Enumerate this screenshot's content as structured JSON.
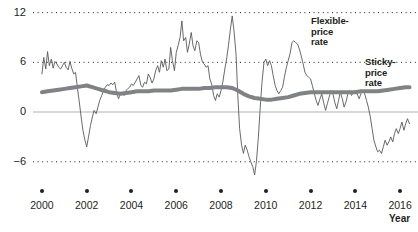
{
  "chart_data": {
    "type": "line",
    "title": "",
    "xlabel": "Year",
    "ylabel": "",
    "xlim": [
      1999.6,
      2016.8
    ],
    "ylim": [
      -8.2,
      12.8
    ],
    "yticks": [
      12,
      6,
      0,
      -6
    ],
    "ytick_labels": [
      "12",
      "6",
      "0",
      "−6"
    ],
    "xticks": [
      2000,
      2002,
      2004,
      2006,
      2008,
      2010,
      2012,
      2014,
      2016
    ],
    "xtick_labels": [
      "2000",
      "2002",
      "2004",
      "2006",
      "2008",
      "2010",
      "2012",
      "2014",
      "2016"
    ],
    "grid": "dotted horizontal gridlines at 12, 6 and -6; solid light line at 0",
    "legend_position": "inline annotations",
    "annotations": [
      {
        "name": "flexible-price-annotation",
        "text": "Flexible-\nprice\nrate",
        "lines": [
          "Flexible-",
          "price",
          "rate"
        ],
        "x": 311,
        "y": 16
      },
      {
        "name": "sticky-price-annotation",
        "text": "Sticky-\nprice\nrate",
        "lines": [
          "Sticky-",
          "price",
          "rate"
        ],
        "x": 365,
        "y": 57
      }
    ],
    "series": [
      {
        "name": "Flexible-price rate",
        "color": "#58595b",
        "width": 0.9,
        "x": [
          2000.0,
          2000.08,
          2000.17,
          2000.25,
          2000.33,
          2000.42,
          2000.5,
          2000.58,
          2000.67,
          2000.75,
          2000.83,
          2000.92,
          2001.0,
          2001.08,
          2001.17,
          2001.25,
          2001.33,
          2001.42,
          2001.5,
          2001.58,
          2001.67,
          2001.75,
          2001.83,
          2001.92,
          2002.0,
          2002.08,
          2002.17,
          2002.25,
          2002.33,
          2002.42,
          2002.5,
          2002.58,
          2002.67,
          2002.75,
          2002.83,
          2002.92,
          2003.0,
          2003.08,
          2003.17,
          2003.25,
          2003.33,
          2003.42,
          2003.5,
          2003.58,
          2003.67,
          2003.75,
          2003.83,
          2003.92,
          2004.0,
          2004.08,
          2004.17,
          2004.25,
          2004.33,
          2004.42,
          2004.5,
          2004.58,
          2004.67,
          2004.75,
          2004.83,
          2004.92,
          2005.0,
          2005.08,
          2005.17,
          2005.25,
          2005.33,
          2005.42,
          2005.5,
          2005.58,
          2005.67,
          2005.75,
          2005.83,
          2005.92,
          2006.0,
          2006.08,
          2006.17,
          2006.25,
          2006.33,
          2006.42,
          2006.5,
          2006.58,
          2006.67,
          2006.75,
          2006.83,
          2006.92,
          2007.0,
          2007.08,
          2007.17,
          2007.25,
          2007.33,
          2007.42,
          2007.5,
          2007.58,
          2007.67,
          2007.75,
          2007.83,
          2007.92,
          2008.0,
          2008.08,
          2008.17,
          2008.25,
          2008.33,
          2008.42,
          2008.5,
          2008.58,
          2008.67,
          2008.75,
          2008.83,
          2008.92,
          2009.0,
          2009.08,
          2009.17,
          2009.25,
          2009.33,
          2009.42,
          2009.5,
          2009.58,
          2009.67,
          2009.75,
          2009.83,
          2009.92,
          2010.0,
          2010.08,
          2010.17,
          2010.25,
          2010.33,
          2010.42,
          2010.5,
          2010.58,
          2010.67,
          2010.75,
          2010.83,
          2010.92,
          2011.0,
          2011.08,
          2011.17,
          2011.25,
          2011.33,
          2011.42,
          2011.5,
          2011.58,
          2011.67,
          2011.75,
          2011.83,
          2011.92,
          2012.0,
          2012.08,
          2012.17,
          2012.25,
          2012.33,
          2012.42,
          2012.5,
          2012.58,
          2012.67,
          2012.75,
          2012.83,
          2012.92,
          2013.0,
          2013.08,
          2013.17,
          2013.25,
          2013.33,
          2013.42,
          2013.5,
          2013.58,
          2013.67,
          2013.75,
          2013.83,
          2013.92,
          2014.0,
          2014.08,
          2014.17,
          2014.25,
          2014.33,
          2014.42,
          2014.5,
          2014.58,
          2014.67,
          2014.75,
          2014.83,
          2014.92,
          2015.0,
          2015.08,
          2015.17,
          2015.25,
          2015.33,
          2015.42,
          2015.5,
          2015.58,
          2015.67,
          2015.75,
          2015.83,
          2015.92,
          2016.0,
          2016.08,
          2016.17,
          2016.25,
          2016.33,
          2016.42
        ],
        "values": [
          4.6,
          6.6,
          5.2,
          7.3,
          5.6,
          6.4,
          5.3,
          6.1,
          5.8,
          5.4,
          5.2,
          5.6,
          6.0,
          5.4,
          5.1,
          6.1,
          5.3,
          4.6,
          4.8,
          3.0,
          1.2,
          -0.6,
          -2.2,
          -3.4,
          -4.2,
          -3.0,
          -1.6,
          -0.6,
          0.2,
          -0.2,
          0.6,
          1.4,
          2.0,
          2.6,
          3.0,
          3.3,
          3.2,
          3.5,
          3.3,
          3.6,
          2.4,
          1.6,
          2.2,
          2.4,
          2.0,
          2.6,
          2.8,
          3.0,
          3.4,
          3.2,
          3.6,
          4.0,
          4.4,
          3.2,
          3.0,
          3.6,
          3.4,
          4.6,
          4.2,
          3.5,
          4.0,
          5.0,
          5.6,
          4.8,
          6.2,
          5.4,
          6.4,
          5.0,
          5.2,
          7.8,
          6.2,
          5.0,
          7.2,
          8.0,
          9.0,
          11.0,
          8.6,
          9.0,
          7.2,
          8.2,
          9.6,
          8.0,
          7.4,
          8.6,
          8.4,
          7.0,
          6.0,
          5.8,
          5.4,
          5.6,
          4.0,
          3.4,
          2.0,
          1.4,
          2.2,
          1.8,
          2.6,
          3.6,
          5.2,
          6.4,
          8.0,
          10.0,
          11.6,
          9.8,
          7.0,
          2.0,
          -2.0,
          -4.0,
          -5.0,
          -4.0,
          -4.6,
          -5.4,
          -6.0,
          -6.6,
          -7.6,
          -6.0,
          -3.0,
          0.5,
          3.6,
          6.0,
          6.4,
          5.6,
          6.2,
          5.6,
          4.4,
          3.2,
          2.6,
          2.2,
          2.6,
          3.0,
          4.2,
          5.4,
          6.2,
          7.0,
          8.4,
          8.6,
          8.4,
          8.2,
          7.6,
          6.8,
          5.8,
          4.8,
          4.4,
          4.2,
          4.0,
          3.2,
          2.2,
          1.4,
          0.8,
          1.6,
          2.2,
          1.2,
          0.2,
          1.0,
          1.8,
          2.6,
          2.2,
          1.2,
          0.4,
          1.4,
          2.4,
          1.6,
          0.6,
          1.2,
          2.2,
          2.6,
          2.0,
          2.4,
          2.6,
          2.2,
          1.6,
          2.2,
          2.6,
          2.2,
          1.4,
          0.6,
          -0.6,
          -2.0,
          -3.4,
          -4.2,
          -4.8,
          -4.6,
          -5.0,
          -4.2,
          -3.4,
          -4.0,
          -3.6,
          -3.0,
          -3.6,
          -2.6,
          -2.0,
          -2.6,
          -2.0,
          -1.2,
          -2.2,
          -1.4,
          -0.8,
          -1.4
        ]
      },
      {
        "name": "Sticky-price rate",
        "color": "#808285",
        "width": 4.0,
        "x": [
          2000.0,
          2000.25,
          2000.5,
          2000.75,
          2001.0,
          2001.25,
          2001.5,
          2001.75,
          2002.0,
          2002.25,
          2002.5,
          2002.75,
          2003.0,
          2003.25,
          2003.5,
          2003.75,
          2004.0,
          2004.25,
          2004.5,
          2004.75,
          2005.0,
          2005.25,
          2005.5,
          2005.75,
          2006.0,
          2006.25,
          2006.5,
          2006.75,
          2007.0,
          2007.25,
          2007.5,
          2007.75,
          2008.0,
          2008.25,
          2008.5,
          2008.75,
          2009.0,
          2009.25,
          2009.5,
          2009.75,
          2010.0,
          2010.25,
          2010.5,
          2010.75,
          2011.0,
          2011.25,
          2011.5,
          2011.75,
          2012.0,
          2012.25,
          2012.5,
          2012.75,
          2013.0,
          2013.25,
          2013.5,
          2013.75,
          2014.0,
          2014.25,
          2014.5,
          2014.75,
          2015.0,
          2015.25,
          2015.5,
          2015.75,
          2016.0,
          2016.25,
          2016.42
        ],
        "values": [
          2.4,
          2.5,
          2.6,
          2.7,
          2.8,
          2.9,
          3.0,
          3.1,
          3.2,
          3.0,
          2.8,
          2.6,
          2.4,
          2.3,
          2.2,
          2.3,
          2.4,
          2.5,
          2.5,
          2.5,
          2.6,
          2.6,
          2.6,
          2.6,
          2.7,
          2.8,
          2.8,
          2.8,
          2.8,
          2.9,
          2.9,
          3.0,
          3.0,
          3.0,
          2.9,
          2.6,
          2.2,
          1.9,
          1.7,
          1.6,
          1.5,
          1.5,
          1.6,
          1.7,
          1.8,
          2.0,
          2.2,
          2.3,
          2.4,
          2.4,
          2.4,
          2.4,
          2.4,
          2.4,
          2.4,
          2.4,
          2.4,
          2.5,
          2.5,
          2.5,
          2.5,
          2.6,
          2.7,
          2.8,
          2.9,
          3.0,
          3.0
        ]
      }
    ]
  }
}
